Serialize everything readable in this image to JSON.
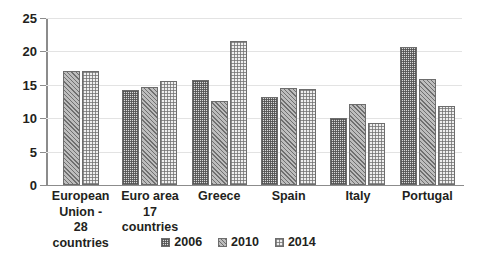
{
  "chart_data": {
    "type": "bar",
    "title": "",
    "subtitle": "",
    "xlabel": "",
    "ylabel": "",
    "ylim": [
      0,
      25
    ],
    "yticks": [
      0,
      5,
      10,
      15,
      20,
      25
    ],
    "ytick_labels": [
      "0",
      "5",
      "10",
      "15",
      "20",
      "25"
    ],
    "grid": true,
    "legend_position": "bottom",
    "categories": [
      "European\nUnion -\n28 countries",
      "Euro area\n17 countries",
      "Greece",
      "Spain",
      "Italy",
      "Portugal"
    ],
    "series": [
      {
        "name": "2006",
        "values": [
          null,
          14.2,
          15.7,
          13.2,
          10.1,
          20.6
        ]
      },
      {
        "name": "2010",
        "values": [
          17.0,
          14.7,
          12.6,
          14.5,
          12.2,
          15.8
        ]
      },
      {
        "name": "2014",
        "values": [
          17.1,
          15.5,
          21.6,
          14.4,
          9.3,
          11.8
        ]
      }
    ]
  },
  "legend": {
    "items": [
      {
        "label": "2006"
      },
      {
        "label": "2010"
      },
      {
        "label": "2014"
      }
    ]
  },
  "colors": {
    "axis": "#8c8c8c",
    "gridline": "#e3e3e3",
    "text": "#231f20",
    "bar_border": "#6d6d6d",
    "series_2006": "#d9d9d9",
    "series_2010": "#bdbdbd",
    "series_2014": "#efefef",
    "background": "#ffffff"
  }
}
